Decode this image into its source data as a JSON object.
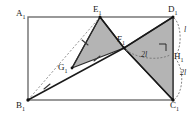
{
  "figure": {
    "kind": "geometry-diagram",
    "background": "#ffffff",
    "canvas": {
      "width": 196,
      "height": 117
    },
    "style": {
      "outline_color": "#6e6e6e",
      "stroke_color": "#1a1a1a",
      "shade_fill": "#b4b4b4",
      "shade_stroke": "#2b2b2b",
      "dash_color": "#8c8c8c",
      "arc_color": "#767676",
      "tick_color": "#3a3a3a"
    },
    "points": [
      {
        "id": "A1",
        "label": "A",
        "sub": "1",
        "x": 28,
        "y": 17,
        "label_x": 16,
        "label_y": 9
      },
      {
        "id": "B1",
        "label": "B",
        "sub": "1",
        "x": 28,
        "y": 100,
        "label_x": 16,
        "label_y": 101
      },
      {
        "id": "C1",
        "label": "C",
        "sub": "1",
        "x": 173,
        "y": 100,
        "label_x": 170,
        "label_y": 101
      },
      {
        "id": "D1",
        "label": "D",
        "sub": "1",
        "x": 173,
        "y": 17,
        "label_x": 168,
        "label_y": 8
      },
      {
        "id": "E1",
        "label": "E",
        "sub": "1",
        "x": 100,
        "y": 17,
        "label_x": 94,
        "label_y": 8
      },
      {
        "id": "F1",
        "label": "F",
        "sub": "1",
        "x": 124,
        "y": 48,
        "label_x": 118,
        "label_y": 36
      },
      {
        "id": "G1",
        "label": "G",
        "sub": "1",
        "x": 72,
        "y": 68,
        "label_x": 59,
        "label_y": 64
      },
      {
        "id": "H1",
        "label": "H",
        "sub": "1",
        "x": 173,
        "y": 57,
        "label_x": 174,
        "label_y": 53
      }
    ],
    "rectangle": {
      "name": "A1B1C1D1",
      "corners": [
        "A1",
        "B1",
        "C1",
        "D1"
      ]
    },
    "shaded_regions": [
      {
        "id": "triangle-E1G1F1",
        "vertices": [
          "E1",
          "G1",
          "F1"
        ]
      },
      {
        "id": "triangle-F1D1C1",
        "vertices": [
          "F1",
          "D1",
          "C1"
        ]
      }
    ],
    "solid_segments": [
      {
        "id": "B1-F1",
        "from": "B1",
        "to": "F1"
      },
      {
        "id": "F1-D1",
        "from": "F1",
        "to": "D1"
      },
      {
        "id": "E1-F1",
        "from": "E1",
        "to": "F1"
      },
      {
        "id": "F1-C1",
        "from": "F1",
        "to": "C1"
      },
      {
        "id": "E1-G1",
        "from": "E1",
        "to": "G1"
      },
      {
        "id": "D1-C1",
        "from": "D1",
        "to": "C1"
      }
    ],
    "dashed_segments": [
      {
        "id": "B1-E1",
        "from": "B1",
        "to": "E1"
      }
    ],
    "tick_marks": [
      {
        "id": "tick-B1G1",
        "on": "B1-G1",
        "x": 47,
        "y": 84,
        "angle": -20
      },
      {
        "id": "tick-G1F1",
        "on": "G1-F1",
        "x": 97,
        "y": 58,
        "angle": -20
      },
      {
        "id": "tick-E1G1",
        "on": "E1-G1",
        "x": 85,
        "y": 43,
        "angle": 62
      }
    ],
    "right_angle": {
      "id": "right-angle-at-H1",
      "at": "H1",
      "x": 160,
      "y": 44,
      "size": 7
    },
    "measurements": [
      {
        "id": "len-D1-H1",
        "text": "l",
        "x": 184,
        "y": 29,
        "arc": "right-upper"
      },
      {
        "id": "len-H1-C1",
        "text": "2l",
        "x": 180,
        "y": 72,
        "arc": "right-lower"
      },
      {
        "id": "len-F1-H1",
        "text": "2l",
        "x": 142,
        "y": 53,
        "arc": "inner-horizontal"
      }
    ]
  }
}
